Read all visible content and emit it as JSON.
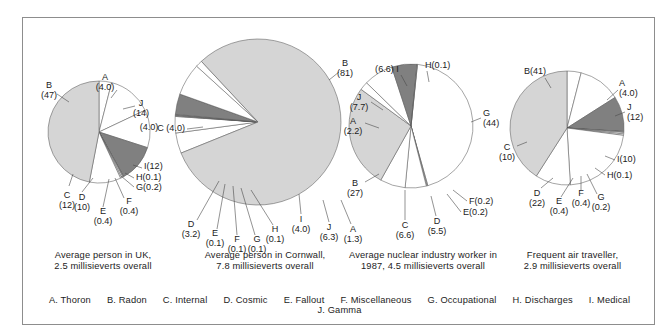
{
  "figure": {
    "title": "",
    "border_color": "#8d8d8d",
    "background": "#ffffff"
  },
  "palette": {
    "light_gray": "#d5d5d5",
    "dark_gray": "#808080",
    "white": "#ffffff",
    "outline": "#5a5a5a",
    "text": "#1c1c1c"
  },
  "legend": {
    "entries": [
      {
        "key": "A",
        "label": "A. Thoron"
      },
      {
        "key": "B",
        "label": "B. Radon"
      },
      {
        "key": "C",
        "label": "C. Internal"
      },
      {
        "key": "D",
        "label": "D. Cosmic"
      },
      {
        "key": "E",
        "label": "E. Fallout"
      },
      {
        "key": "F",
        "label": "F. Miscellaneous"
      },
      {
        "key": "G",
        "label": "G. Occupational"
      },
      {
        "key": "H",
        "label": "H. Discharges"
      },
      {
        "key": "I",
        "label": "I. Medical"
      },
      {
        "key": "J",
        "label": "J. Gamma"
      }
    ]
  },
  "chart_data": [
    {
      "type": "pie",
      "id": "uk",
      "title": "Average person in UK, 2.5 millisieverts overall",
      "caption_line1": "Average person in UK,",
      "caption_line2": "2.5 millisieverts overall",
      "total_msv": 2.5,
      "unit": "percent",
      "radius_px": 51,
      "slices": [
        {
          "key": "A",
          "name": "Thoron",
          "value": 4.0,
          "label": "A",
          "value_label": "(4.0)",
          "fill": "#ffffff"
        },
        {
          "key": "J",
          "name": "Gamma",
          "value": 14,
          "label": "J",
          "value_label": "(14)",
          "fill": "#ffffff"
        },
        {
          "key": "C",
          "name": "Internal",
          "value": 12,
          "label": "C",
          "value_label": "(12)",
          "fill": "#ffffff"
        },
        {
          "key": "I",
          "name": "Medical",
          "value": 12,
          "label": "I(12)",
          "value_label": "",
          "fill": "#808080"
        },
        {
          "key": "H",
          "name": "Discharges",
          "value": 0.1,
          "label": "H(0.1)",
          "value_label": "",
          "fill": "#ffffff"
        },
        {
          "key": "G",
          "name": "Occupational",
          "value": 0.2,
          "label": "G(0.2)",
          "value_label": "",
          "fill": "#ffffff"
        },
        {
          "key": "F",
          "name": "Miscellaneous",
          "value": 0.4,
          "label": "F",
          "value_label": "(0.4)",
          "fill": "#ffffff"
        },
        {
          "key": "E",
          "name": "Fallout",
          "value": 0.4,
          "label": "E",
          "value_label": "(0.4)",
          "fill": "#ffffff"
        },
        {
          "key": "D",
          "name": "Cosmic",
          "value": 10,
          "label": "D",
          "value_label": "(10)",
          "fill": "#ffffff"
        },
        {
          "key": "B",
          "name": "Radon",
          "value": 47,
          "label": "B",
          "value_label": "(47)",
          "fill": "#d5d5d5"
        }
      ],
      "second_value_label": "(4.0)"
    },
    {
      "type": "pie",
      "id": "cornwall",
      "title": "Average person in Cornwall, 7.8 millisieverts overall",
      "caption_line1": "Average person in Cornwall,",
      "caption_line2": "7.8 millisieverts overall",
      "total_msv": 7.8,
      "unit": "percent",
      "radius_px": 83,
      "slices": [
        {
          "key": "C",
          "name": "Internal",
          "value": 4.0,
          "label": "C",
          "value_label": "(4.0)",
          "fill": "#ffffff"
        },
        {
          "key": "D",
          "name": "Cosmic",
          "value": 3.2,
          "label": "D",
          "value_label": "(3.2)",
          "fill": "#ffffff"
        },
        {
          "key": "E",
          "name": "Fallout",
          "value": 0.1,
          "label": "E",
          "value_label": "(0.1)",
          "fill": "#ffffff"
        },
        {
          "key": "F",
          "name": "Miscellaneous",
          "value": 0.1,
          "label": "F",
          "value_label": "(0.1)",
          "fill": "#ffffff"
        },
        {
          "key": "G",
          "name": "Occupational",
          "value": 0.1,
          "label": "G",
          "value_label": "(0.1)",
          "fill": "#ffffff"
        },
        {
          "key": "H",
          "name": "Discharges",
          "value": 0.1,
          "label": "H",
          "value_label": "(0.1)",
          "fill": "#ffffff"
        },
        {
          "key": "I",
          "name": "Medical",
          "value": 4.0,
          "label": "I",
          "value_label": "(4.0)",
          "fill": "#808080"
        },
        {
          "key": "J",
          "name": "Gamma",
          "value": 6.3,
          "label": "J",
          "value_label": "(6.3)",
          "fill": "#ffffff"
        },
        {
          "key": "A",
          "name": "Thoron",
          "value": 1.3,
          "label": "A",
          "value_label": "(1.3)",
          "fill": "#ffffff"
        },
        {
          "key": "B",
          "name": "Radon",
          "value": 81,
          "label": "B",
          "value_label": "(81)",
          "fill": "#d5d5d5"
        }
      ]
    },
    {
      "type": "pie",
      "id": "nuclear-worker",
      "title": "Average nuclear industry worker in 1987, 4.5 millisieverts overall",
      "caption_line1": "Average nuclear industry worker in",
      "caption_line2": "1987, 4.5 millisieverts overall",
      "total_msv": 4.5,
      "year": 1987,
      "unit": "percent",
      "radius_px": 62,
      "slices": [
        {
          "key": "G",
          "name": "Occupational",
          "value": 44,
          "label": "G",
          "value_label": "(44)",
          "fill": "#ffffff"
        },
        {
          "key": "F",
          "name": "Miscellaneous",
          "value": 0.2,
          "label": "F(0.2)",
          "value_label": "",
          "fill": "#ffffff"
        },
        {
          "key": "E",
          "name": "Fallout",
          "value": 0.2,
          "label": "E(0.2)",
          "value_label": "",
          "fill": "#ffffff"
        },
        {
          "key": "D",
          "name": "Cosmic",
          "value": 5.5,
          "label": "D",
          "value_label": "(5.5)",
          "fill": "#ffffff"
        },
        {
          "key": "C",
          "name": "Internal",
          "value": 6.6,
          "label": "C",
          "value_label": "(6.6)",
          "fill": "#ffffff"
        },
        {
          "key": "B",
          "name": "Radon",
          "value": 27,
          "label": "B",
          "value_label": "(27)",
          "fill": "#d5d5d5"
        },
        {
          "key": "A",
          "name": "Thoron",
          "value": 2.2,
          "label": "A",
          "value_label": "(2.2)",
          "fill": "#ffffff"
        },
        {
          "key": "J",
          "name": "Gamma",
          "value": 7.7,
          "label": "J",
          "value_label": "(7.7)",
          "fill": "#ffffff"
        },
        {
          "key": "I",
          "name": "Medical",
          "value": 6.6,
          "label": "(6.6) I",
          "value_label": "",
          "fill": "#808080"
        },
        {
          "key": "H",
          "name": "Discharges",
          "value": 0.1,
          "label": "H(0.1)",
          "value_label": "",
          "fill": "#ffffff"
        }
      ]
    },
    {
      "type": "pie",
      "id": "air-traveller",
      "title": "Frequent air traveller, 2.9 millisieverts overall",
      "caption_line1": "Frequent air traveller,",
      "caption_line2": "2.9 millisieverts overall",
      "total_msv": 2.9,
      "unit": "percent",
      "radius_px": 57,
      "slices": [
        {
          "key": "A",
          "name": "Thoron",
          "value": 4.0,
          "label": "A",
          "value_label": "(4.0)",
          "fill": "#ffffff"
        },
        {
          "key": "J",
          "name": "Gamma",
          "value": 12,
          "label": "J",
          "value_label": "(12)",
          "fill": "#ffffff"
        },
        {
          "key": "I",
          "name": "Medical",
          "value": 10,
          "label": "I(10)",
          "value_label": "",
          "fill": "#808080"
        },
        {
          "key": "H",
          "name": "Discharges",
          "value": 0.1,
          "label": "H(0.1)",
          "value_label": "",
          "fill": "#ffffff"
        },
        {
          "key": "G",
          "name": "Occupational",
          "value": 0.2,
          "label": "G",
          "value_label": "(0.2)",
          "fill": "#ffffff"
        },
        {
          "key": "F",
          "name": "Miscellaneous",
          "value": 0.4,
          "label": "F",
          "value_label": "(0.4)",
          "fill": "#ffffff"
        },
        {
          "key": "E",
          "name": "Fallout",
          "value": 0.4,
          "label": "E",
          "value_label": "(0.4)",
          "fill": "#ffffff"
        },
        {
          "key": "D",
          "name": "Cosmic",
          "value": 22,
          "label": "D",
          "value_label": "(22)",
          "fill": "#ffffff"
        },
        {
          "key": "C",
          "name": "Internal",
          "value": 10,
          "label": "C",
          "value_label": "(10)",
          "fill": "#ffffff"
        },
        {
          "key": "B",
          "name": "Radon",
          "value": 41,
          "label": "B(41)",
          "value_label": "",
          "fill": "#d5d5d5"
        }
      ]
    }
  ]
}
